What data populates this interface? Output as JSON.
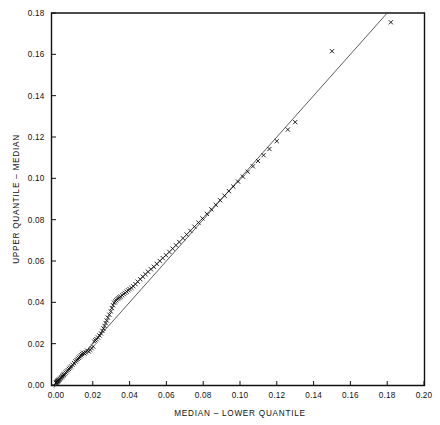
{
  "chart_data": {
    "type": "scatter",
    "title": "",
    "xlabel": "MEDIAN  –  LOWER QUANTILE",
    "ylabel": "UPPER QUANTILE  –  MEDIAN",
    "xlim": [
      -0.003,
      0.2
    ],
    "ylim": [
      -0.0015,
      0.18
    ],
    "xticks": [
      0.0,
      0.02,
      0.04,
      0.06,
      0.08,
      0.1,
      0.12,
      0.14,
      0.16,
      0.18,
      0.2
    ],
    "yticks": [
      0.0,
      0.02,
      0.04,
      0.06,
      0.08,
      0.1,
      0.12,
      0.14,
      0.16,
      0.18
    ],
    "xtick_labels": [
      "0.00",
      "0.02",
      "0.04",
      "0.06",
      "0.08",
      "0.10",
      "0.12",
      "0.14",
      "0.16",
      "0.18",
      "0.20"
    ],
    "ytick_labels": [
      "0.00",
      "0.02",
      "0.04",
      "0.06",
      "0.08",
      "0.10",
      "0.12",
      "0.14",
      "0.16",
      "0.18"
    ],
    "grid": false,
    "legend": "none",
    "marker": "x",
    "marker_color": "#0d0d0d",
    "frame_color": "#111111",
    "series": [
      {
        "name": "quantile-pairs",
        "x": [
          0.0,
          0.0002,
          0.0004,
          0.0006,
          0.0008,
          0.001,
          0.0012,
          0.0015,
          0.0018,
          0.0022,
          0.0026,
          0.003,
          0.0034,
          0.0038,
          0.0042,
          0.0046,
          0.0052,
          0.0058,
          0.0064,
          0.007,
          0.0076,
          0.0082,
          0.009,
          0.0098,
          0.0106,
          0.0112,
          0.0118,
          0.0124,
          0.013,
          0.0136,
          0.0142,
          0.0148,
          0.0155,
          0.0162,
          0.017,
          0.0178,
          0.0186,
          0.0194,
          0.0202,
          0.0208,
          0.0214,
          0.022,
          0.0228,
          0.0236,
          0.0244,
          0.0252,
          0.0258,
          0.0264,
          0.027,
          0.0276,
          0.0282,
          0.029,
          0.0298,
          0.0304,
          0.031,
          0.0316,
          0.0322,
          0.0328,
          0.0334,
          0.034,
          0.0346,
          0.0352,
          0.036,
          0.0368,
          0.0376,
          0.0384,
          0.0392,
          0.04,
          0.041,
          0.042,
          0.0432,
          0.0444,
          0.0458,
          0.0472,
          0.0486,
          0.05,
          0.0516,
          0.0532,
          0.0548,
          0.0564,
          0.058,
          0.0598,
          0.0616,
          0.0634,
          0.0652,
          0.067,
          0.069,
          0.071,
          0.073,
          0.0752,
          0.0774,
          0.0796,
          0.082,
          0.0844,
          0.0868,
          0.0892,
          0.0916,
          0.094,
          0.0964,
          0.099,
          0.1016,
          0.1042,
          0.107,
          0.1098,
          0.1128,
          0.116,
          0.12,
          0.126,
          0.13,
          0.15,
          0.182
        ],
        "y": [
          0.001,
          0.0012,
          0.0014,
          0.0016,
          0.0018,
          0.002,
          0.0022,
          0.0024,
          0.0026,
          0.003,
          0.0034,
          0.0038,
          0.0042,
          0.0046,
          0.005,
          0.0054,
          0.006,
          0.0066,
          0.0072,
          0.0078,
          0.0084,
          0.009,
          0.0098,
          0.0106,
          0.0114,
          0.012,
          0.0126,
          0.0132,
          0.0138,
          0.0144,
          0.015,
          0.0156,
          0.0152,
          0.0158,
          0.0166,
          0.0162,
          0.017,
          0.0178,
          0.0186,
          0.021,
          0.0216,
          0.0222,
          0.023,
          0.024,
          0.025,
          0.0262,
          0.0274,
          0.0286,
          0.03,
          0.0312,
          0.0326,
          0.034,
          0.0356,
          0.0372,
          0.0386,
          0.0398,
          0.0404,
          0.041,
          0.0416,
          0.042,
          0.0424,
          0.0428,
          0.0434,
          0.044,
          0.0446,
          0.0452,
          0.0458,
          0.0464,
          0.047,
          0.0478,
          0.0488,
          0.05,
          0.0512,
          0.0524,
          0.0536,
          0.0548,
          0.056,
          0.0572,
          0.0586,
          0.06,
          0.0614,
          0.0628,
          0.0644,
          0.066,
          0.0676,
          0.0692,
          0.071,
          0.0728,
          0.0746,
          0.0766,
          0.0786,
          0.0806,
          0.0828,
          0.085,
          0.0872,
          0.0894,
          0.0916,
          0.0938,
          0.096,
          0.0984,
          0.1008,
          0.1032,
          0.1058,
          0.1084,
          0.1112,
          0.1142,
          0.118,
          0.1236,
          0.1272,
          0.1615,
          0.1755
        ]
      }
    ],
    "reference_line": {
      "name": "y = x",
      "x_start": -0.0012,
      "y_start": -0.0012,
      "x_end": 0.18,
      "y_end": 0.18
    }
  }
}
